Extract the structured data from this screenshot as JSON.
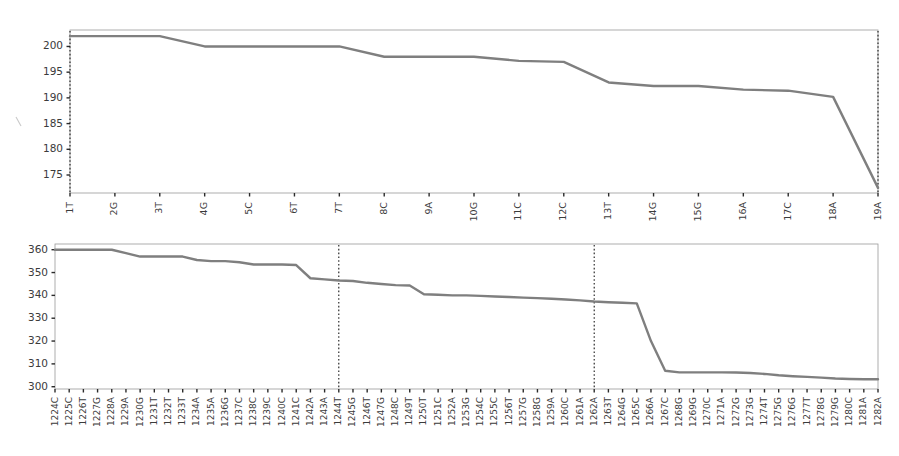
{
  "figure": {
    "background_color": "#ffffff",
    "line_color": "#7f7f7f",
    "frame_color": "#9a9a9a",
    "reference_line_color": "#1a1a1a",
    "tick_color": "#2b2b2b",
    "label_color": "#3b3b3b"
  },
  "chart_data": [
    {
      "type": "line",
      "title": "",
      "xlabel": "",
      "ylabel": "",
      "grid": false,
      "legend": false,
      "ylim": [
        171.5,
        203.2
      ],
      "yticks": [
        175,
        180,
        185,
        190,
        195,
        200
      ],
      "ytick_labels": [
        "175",
        "180",
        "185",
        "190",
        "195",
        "200"
      ],
      "categories": [
        "1T",
        "2G",
        "3T",
        "4G",
        "5C",
        "6T",
        "7T",
        "8C",
        "9A",
        "10G",
        "11C",
        "12C",
        "13T",
        "14G",
        "15G",
        "16A",
        "17C",
        "18A",
        "19A"
      ],
      "values": [
        202.0,
        202.0,
        202.0,
        200.0,
        200.0,
        200.0,
        200.0,
        198.0,
        198.0,
        198.0,
        197.2,
        197.0,
        193.0,
        192.3,
        192.3,
        191.6,
        191.4,
        190.2,
        172.5
      ],
      "reference_lines": [
        {
          "category": "1T",
          "style": "dotted"
        },
        {
          "category": "19A",
          "style": "dotted"
        }
      ]
    },
    {
      "type": "line",
      "title": "",
      "xlabel": "",
      "ylabel": "",
      "grid": false,
      "legend": false,
      "ylim": [
        299.0,
        362.5
      ],
      "yticks": [
        300,
        310,
        320,
        330,
        340,
        350,
        360
      ],
      "ytick_labels": [
        "300",
        "310",
        "320",
        "330",
        "340",
        "350",
        "360"
      ],
      "categories": [
        "1224C",
        "1225C",
        "1226T",
        "1227G",
        "1228A",
        "1229A",
        "1230G",
        "1231T",
        "1232T",
        "1233T",
        "1234A",
        "1235A",
        "1236G",
        "1237C",
        "1238C",
        "1239C",
        "1240C",
        "1241C",
        "1242A",
        "1243A",
        "1244T",
        "1245G",
        "1246T",
        "1247G",
        "1248C",
        "1249T",
        "1250T",
        "1251C",
        "1252A",
        "1253G",
        "1254C",
        "1255C",
        "1256T",
        "1257G",
        "1258G",
        "1259A",
        "1260C",
        "1261A",
        "1262A",
        "1263T",
        "1264G",
        "1265C",
        "1266A",
        "1267C",
        "1268G",
        "1269G",
        "1270C",
        "1271A",
        "1272G",
        "1273G",
        "1274T",
        "1275G",
        "1276G",
        "1277T",
        "1278G",
        "1279G",
        "1280C",
        "1281A",
        "1282A"
      ],
      "values": [
        360.0,
        360.0,
        360.0,
        360.0,
        360.0,
        358.5,
        357.0,
        357.0,
        357.0,
        357.0,
        355.5,
        355.0,
        355.0,
        354.5,
        353.5,
        353.5,
        353.5,
        353.3,
        347.5,
        347.0,
        346.5,
        346.3,
        345.5,
        345.0,
        344.5,
        344.3,
        340.5,
        340.3,
        340.0,
        340.0,
        339.8,
        339.5,
        339.3,
        339.0,
        338.8,
        338.5,
        338.2,
        337.8,
        337.3,
        337.0,
        336.8,
        336.5,
        320.0,
        307.0,
        306.3,
        306.3,
        306.3,
        306.3,
        306.2,
        306.0,
        305.6,
        305.0,
        304.6,
        304.3,
        304.0,
        303.6,
        303.4,
        303.3,
        303.3
      ],
      "reference_lines": [
        {
          "category": "1244T",
          "style": "dotted"
        },
        {
          "category": "1262A",
          "style": "dotted"
        }
      ]
    }
  ]
}
